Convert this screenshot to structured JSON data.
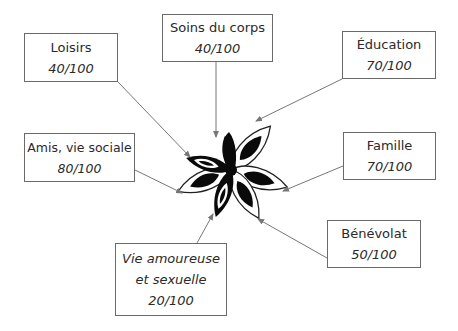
{
  "diagram": {
    "type": "radial-life-domains",
    "center": {
      "label": "flower",
      "x": 231,
      "y": 170
    },
    "nodes": [
      {
        "id": "loisirs",
        "label": "Loisirs",
        "value": "40/100",
        "box": [
          24,
          33,
          94,
          49
        ],
        "arrow": [
          118,
          82,
          190,
          157
        ]
      },
      {
        "id": "soins",
        "label": "Soins du corps",
        "value": "40/100",
        "box": [
          162,
          14,
          111,
          48
        ],
        "arrow": [
          216,
          62,
          216,
          137
        ]
      },
      {
        "id": "education",
        "label": "Éducation",
        "value": "70/100",
        "box": [
          342,
          31,
          94,
          48
        ],
        "arrow": [
          342,
          79,
          256,
          121
        ]
      },
      {
        "id": "amis",
        "label": "Amis, vie sociale",
        "value": "80/100",
        "box": [
          24,
          133,
          111,
          49
        ],
        "arrow": [
          135,
          170,
          182,
          193
        ]
      },
      {
        "id": "famille",
        "label": "Famille",
        "value": "70/100",
        "box": [
          343,
          132,
          93,
          48
        ],
        "arrow": [
          343,
          166,
          283,
          191
        ]
      },
      {
        "id": "benevolat",
        "label": "Bénévolat",
        "value": "50/100",
        "box": [
          327,
          220,
          94,
          48
        ],
        "arrow": [
          327,
          258,
          258,
          219
        ]
      },
      {
        "id": "vie",
        "label": "Vie amoureuse",
        "label2": "et sexuelle",
        "value": "20/100",
        "box": [
          115,
          243,
          112,
          73
        ],
        "arrow": [
          197,
          243,
          213,
          214
        ]
      }
    ]
  },
  "colors": {
    "line": "#777777",
    "border": "#6a6a6a",
    "text": "#2a2a2a",
    "petal": "#0a0a0a"
  }
}
